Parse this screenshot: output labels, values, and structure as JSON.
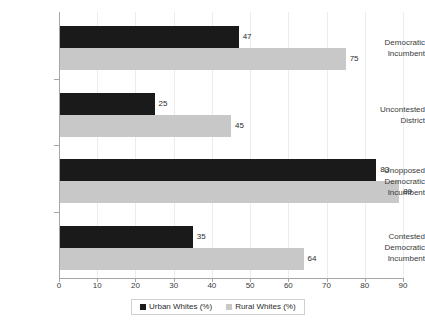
{
  "chart_data": {
    "type": "bar",
    "orientation": "horizontal",
    "title": "",
    "xlabel": "",
    "ylabel": "",
    "categories": [
      "Democratic Incumbent",
      "Uncontested District",
      "Unopposed Democratic Incumbent",
      "Contested Democratic Incumbent"
    ],
    "series": [
      {
        "name": "Urban Whites (%)",
        "color": "#1a1a1a",
        "values": [
          47,
          25,
          83,
          35
        ]
      },
      {
        "name": "Rural Whites (%)",
        "color": "#c8c8c8",
        "values": [
          75,
          45,
          89,
          64
        ]
      }
    ],
    "xlim": [
      0,
      90
    ],
    "xticks": [
      0,
      10,
      20,
      30,
      40,
      50,
      60,
      70,
      80,
      90
    ],
    "grid": "vertical",
    "legend_position": "bottom"
  },
  "category_lines": [
    [
      "Democratic",
      "Incumbent"
    ],
    [
      "Uncontested",
      "District"
    ],
    [
      "Unopposed",
      "Democratic",
      "Incumbent"
    ],
    [
      "Contested",
      "Democratic",
      "Incumbent"
    ]
  ],
  "legend": {
    "items": [
      {
        "label": "Urban Whites (%)",
        "swatch": "urban"
      },
      {
        "label": "Rural Whites (%)",
        "swatch": "rural"
      }
    ]
  }
}
